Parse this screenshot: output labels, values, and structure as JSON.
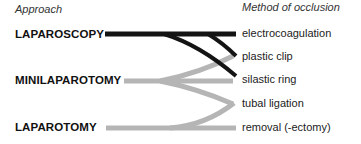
{
  "headers": {
    "left": "Approach",
    "right": "Method of occlusion"
  },
  "approaches": [
    {
      "label": "LAPAROSCOPY",
      "color": "#111111"
    },
    {
      "label": "MINILAPAROTOMY",
      "color": "#b3b3b3"
    },
    {
      "label": "LAPAROTOMY",
      "color": "#b3b3b3"
    }
  ],
  "methods": [
    {
      "label": "electrocoagulation"
    },
    {
      "label": "plastic clip"
    },
    {
      "label": "silastic ring"
    },
    {
      "label": "tubal ligation"
    },
    {
      "label": "removal (-ectomy)"
    }
  ],
  "links": [
    {
      "from": "LAPAROSCOPY",
      "to": "electrocoagulation"
    },
    {
      "from": "LAPAROSCOPY",
      "to": "plastic clip"
    },
    {
      "from": "LAPAROSCOPY",
      "to": "silastic ring"
    },
    {
      "from": "MINILAPAROTOMY",
      "to": "plastic clip"
    },
    {
      "from": "MINILAPAROTOMY",
      "to": "silastic ring"
    },
    {
      "from": "MINILAPAROTOMY",
      "to": "tubal ligation"
    },
    {
      "from": "LAPAROTOMY",
      "to": "tubal ligation"
    },
    {
      "from": "LAPAROTOMY",
      "to": "removal (-ectomy)"
    }
  ]
}
